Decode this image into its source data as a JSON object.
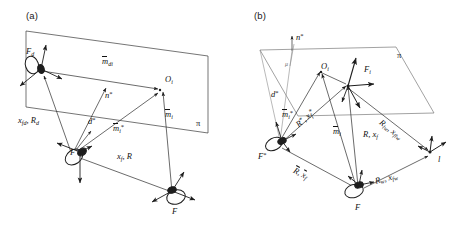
{
  "figure": {
    "background_color": "#ffffff",
    "line_color": "#2b2b2b",
    "text_color": "#111111",
    "width": 475,
    "height": 234
  },
  "panels": [
    {
      "id": "a",
      "label": "(a)",
      "description": "Single plane pi with three camera frames Fd, F* and F observing feature point Oi",
      "plane_label": "π",
      "frames": [
        {
          "name": "desired-camera-frame",
          "label": "F",
          "sub": "d"
        },
        {
          "name": "reference-camera-frame",
          "label": "F",
          "sup": "*"
        },
        {
          "name": "current-camera-frame",
          "label": "F",
          "sub": ""
        }
      ],
      "points": [
        {
          "name": "feature-point",
          "label": "O",
          "sub": "i"
        }
      ],
      "vectors": [
        {
          "name": "mdi-vector",
          "label": "m",
          "sub": "di",
          "overline": true
        },
        {
          "name": "mi-vector",
          "label": "m",
          "sub": "i",
          "overline": true
        },
        {
          "name": "mi-star-vector",
          "label": "m",
          "sub": "i",
          "sup": "*",
          "overline": true
        },
        {
          "name": "normal-vector",
          "label": "n",
          "sup": "*"
        },
        {
          "name": "distance-d-star",
          "label": "d",
          "sup": "*"
        }
      ],
      "transforms": [
        {
          "name": "xfd-Rd-transform",
          "text": "x_fd , R_d",
          "parts": [
            "x",
            "fd",
            "R",
            "d"
          ]
        },
        {
          "name": "xf-R-transform",
          "text": "x_f , R",
          "parts": [
            "x",
            "f",
            "R",
            ""
          ]
        }
      ]
    },
    {
      "id": "b",
      "label": "(b)",
      "description": "Plane pi with frames F*, F, Fi and l, feature point Oi, normal n*, distance d*",
      "plane_label": "π",
      "frames": [
        {
          "name": "reference-camera-frame",
          "label": "F",
          "sup": "*"
        },
        {
          "name": "current-camera-frame",
          "label": "F"
        },
        {
          "name": "i-th-camera-frame",
          "label": "F",
          "sub": "i"
        },
        {
          "name": "l-frame",
          "label": "l"
        }
      ],
      "points": [
        {
          "name": "feature-point",
          "label": "O",
          "sub": "i"
        }
      ],
      "vectors": [
        {
          "name": "mi-vector",
          "label": "m",
          "sub": "i",
          "overline": true
        },
        {
          "name": "mi-star-vector",
          "label": "m",
          "sub": "i",
          "sup": "*",
          "overline": true
        },
        {
          "name": "normal-vector",
          "label": "n",
          "sup": "*"
        },
        {
          "name": "distance-d-star",
          "label": "d",
          "sup": "*"
        },
        {
          "name": "mu-label",
          "label": "μ"
        }
      ],
      "transforms": [
        {
          "name": "R-star-xf-star-transform",
          "text": "R*, x_f*"
        },
        {
          "name": "Rbar-xfbar-transform",
          "text": "R̄, x̄_f"
        },
        {
          "name": "R-xf-transform",
          "text": "R, x_f"
        },
        {
          "name": "Rlw-xflw-transform",
          "text": "R_lw , x_flw"
        },
        {
          "name": "Rw-xfw-transform",
          "text": "R_w , x_fw"
        }
      ]
    }
  ],
  "labels": {
    "panel_a_tag": "(a)",
    "panel_b_tag": "(b)",
    "pi": "π",
    "mu": "μ",
    "m": "m",
    "n": "n",
    "d": "d",
    "O": "O",
    "F": "F",
    "R": "R",
    "x": "x",
    "l": "l",
    "star": "*",
    "sub_i": "i",
    "sub_d": "d",
    "sub_di": "di",
    "sub_f": "f",
    "sub_fd": "fd",
    "sub_w": "w",
    "sub_lw": "lw",
    "sub_fw": "fw",
    "sub_flw": "flw",
    "comma": ","
  }
}
